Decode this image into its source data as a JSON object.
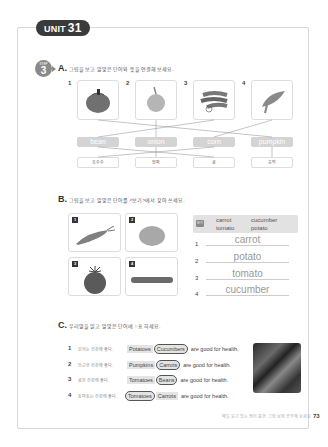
{
  "unit": {
    "label": "UNIT",
    "number": "31"
  },
  "step": {
    "label": "STEP",
    "number": "3"
  },
  "section_a": {
    "letter": "A.",
    "instruction": "그림을 보고 알맞은 단어와 뜻을 연결해 보세요.",
    "images": [
      {
        "num": "1",
        "icon": "pumpkin"
      },
      {
        "num": "2",
        "icon": "onion"
      },
      {
        "num": "3",
        "icon": "bean"
      },
      {
        "num": "4",
        "icon": "corn"
      }
    ],
    "words": [
      "bean",
      "onion",
      "corn",
      "pumpkin"
    ],
    "meanings": [
      "옥수수",
      "양파",
      "콩",
      "호박"
    ]
  },
  "section_b": {
    "letter": "B.",
    "instruction": "그림을 보고 알맞은 단어를 <보기>에서 찾아 쓰세요.",
    "images": [
      {
        "num": "1",
        "icon": "carrot"
      },
      {
        "num": "2",
        "icon": "potato"
      },
      {
        "num": "3",
        "icon": "tomato"
      },
      {
        "num": "4",
        "icon": "cucumber"
      }
    ],
    "word_bank_label": "보기",
    "word_bank": [
      "carrot",
      "cucumber",
      "tomato",
      "potato"
    ],
    "answers": [
      {
        "num": "1",
        "text": "carrot"
      },
      {
        "num": "2",
        "text": "potato"
      },
      {
        "num": "3",
        "text": "tomato"
      },
      {
        "num": "4",
        "text": "cucumber"
      }
    ]
  },
  "section_c": {
    "letter": "C.",
    "instruction": "우리말을 읽고 알맞은 단어에 ○표 하세요.",
    "items": [
      {
        "num": "1",
        "korean": "오이는 건강에 좋다.",
        "opt1": "Potatoes",
        "opt2": "Cucumbers",
        "circled": 2,
        "rest": "are good for health."
      },
      {
        "num": "2",
        "korean": "당근은 건강에 좋다.",
        "opt1": "Pumpkins",
        "opt2": "Carrots",
        "circled": 2,
        "rest": "are good for health."
      },
      {
        "num": "3",
        "korean": "콩은 건강에 좋다.",
        "opt1": "Tomatoes",
        "opt2": "Beans",
        "circled": 2,
        "rest": "are good for health."
      },
      {
        "num": "4",
        "korean": "토마토는 건강에 좋다.",
        "opt1": "Tomatoes",
        "opt2": "Carrots",
        "circled": 1,
        "rest": "are good for health."
      }
    ]
  },
  "footer": {
    "text": "매일 읽고 있는 영어 표현 그림 보며 공부해 보세요",
    "page": "73"
  }
}
